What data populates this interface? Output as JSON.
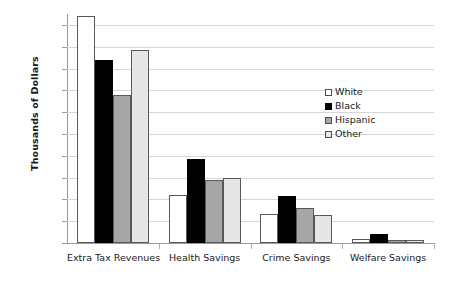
{
  "chart_data": {
    "type": "bar",
    "title": "",
    "xlabel": "",
    "ylabel": "Thousands of Dollars",
    "categories": [
      "Extra Tax Revenues",
      "Health Savings",
      "Crime Savings",
      "Welfare Savings"
    ],
    "series": [
      {
        "name": "White",
        "color": "#ffffff",
        "values": [
          156,
          33,
          20,
          3
        ]
      },
      {
        "name": "Black",
        "color": "#000000",
        "values": [
          126,
          58,
          32,
          6
        ]
      },
      {
        "name": "Hispanic",
        "color": "#a6a6a6",
        "values": [
          102,
          43,
          24,
          2
        ]
      },
      {
        "name": "Other",
        "color": "#e6e6e6",
        "values": [
          133,
          45,
          19,
          2
        ]
      }
    ],
    "ylim": [
      0,
      157.5
    ],
    "yticks": [
      0,
      15,
      30,
      45,
      60,
      75,
      90,
      105,
      120,
      135,
      150
    ],
    "ytick_labels": [
      "0",
      "15",
      "30",
      "45",
      "60",
      "75",
      "90",
      "105",
      "120",
      "135",
      "150"
    ],
    "grid": true,
    "grid_axis": "y",
    "legend_position": "inside-right"
  },
  "legend": {
    "items": [
      {
        "label": "White"
      },
      {
        "label": "Black"
      },
      {
        "label": "Hispanic"
      },
      {
        "label": "Other"
      }
    ]
  }
}
